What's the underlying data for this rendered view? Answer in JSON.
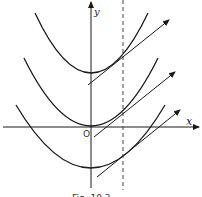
{
  "figure": {
    "axis_labels": {
      "x": "x",
      "y": "y",
      "origin": "O"
    },
    "caption": "Fig. 10.3",
    "curves": [
      {
        "name": "parabola-top",
        "vertex": [
          91,
          73
        ]
      },
      {
        "name": "parabola-middle",
        "vertex": [
          91,
          126
        ]
      },
      {
        "name": "parabola-bottom",
        "vertex": [
          91,
          168
        ]
      }
    ],
    "dashed_line_x": 123,
    "colors": {
      "stroke": "#1a1a1a",
      "background": "#ffffff"
    }
  }
}
